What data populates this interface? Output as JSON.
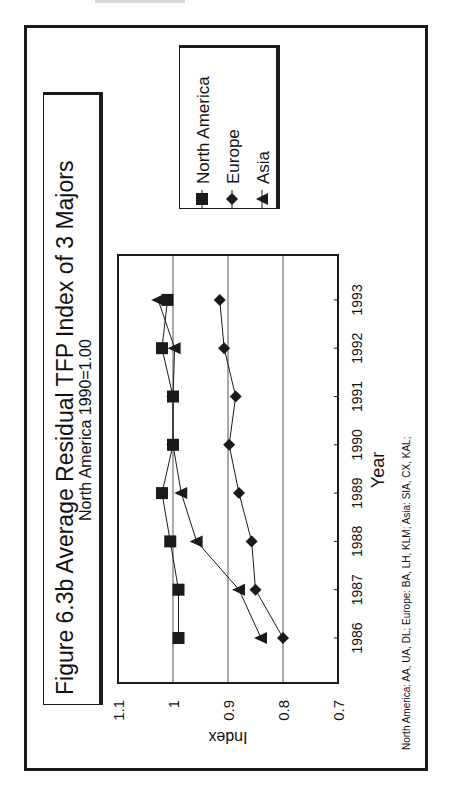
{
  "chart_data": {
    "type": "line",
    "title": "Figure 6.3b  Average Residual TFP Index of 3 Majors",
    "subtitle": "North America 1990=1.00",
    "xlabel": "Year",
    "ylabel": "Index",
    "categories": [
      "1986",
      "1987",
      "1988",
      "1989",
      "1990",
      "1991",
      "1992",
      "1993"
    ],
    "series": [
      {
        "name": "North America",
        "marker": "square",
        "values": [
          0.99,
          0.99,
          1.005,
          1.02,
          1.0,
          1.0,
          1.02,
          1.01
        ]
      },
      {
        "name": "Europe",
        "marker": "diamond",
        "values": [
          0.8,
          0.85,
          0.857,
          0.88,
          0.898,
          0.886,
          0.907,
          0.915
        ]
      },
      {
        "name": "Asia",
        "marker": "triangle",
        "values": [
          0.84,
          0.88,
          0.957,
          0.985,
          1.0,
          1.0,
          0.997,
          1.027
        ]
      }
    ],
    "ylim": [
      0.7,
      1.1
    ],
    "yticks": [
      "1.1",
      "1",
      "0.9",
      "0.8",
      "0.7"
    ],
    "grid": true,
    "legend_position": "right",
    "orientation": "rotated 90 degrees counter-clockwise on page",
    "footnote": "North America: AA, UA, DL;  Europe: BA, LH, KLM;  Asia: SIA, CX, KAL;"
  },
  "colors": {
    "ink": "#1a1a1a",
    "grid": "#555555",
    "background": "#ffffff"
  }
}
